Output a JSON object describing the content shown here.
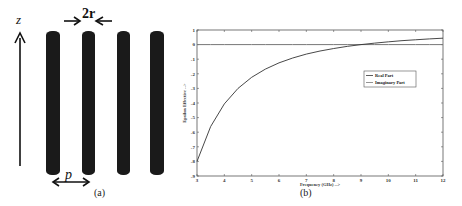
{
  "panel_a": {
    "caption": "(a)",
    "axis_label": "z",
    "radius_label": "2r",
    "period_label": "p",
    "wire_count": 4,
    "wire_color": "#1a1a1a"
  },
  "panel_b": {
    "caption": "(b)"
  },
  "chart_data": {
    "type": "line",
    "title": "",
    "xlabel": "Frequency (GHz) -->",
    "ylabel": "Epsilon Effective -->",
    "xlim": [
      3,
      12
    ],
    "ylim": [
      -9,
      1
    ],
    "xticks": [
      3,
      4,
      5,
      6,
      7,
      8,
      9,
      10,
      11,
      12
    ],
    "yticks": [
      1,
      0,
      -1,
      -2,
      -3,
      -4,
      -5,
      -6,
      -7,
      -8,
      -9
    ],
    "grid": false,
    "legend_position": "center-right",
    "x": [
      3,
      3.5,
      4,
      4.5,
      5,
      5.5,
      6,
      6.5,
      7,
      7.5,
      8,
      8.5,
      9,
      9.5,
      10,
      10.5,
      11,
      11.5,
      12
    ],
    "series": [
      {
        "name": "Real Part",
        "values": [
          -8.0,
          -5.61,
          -4.06,
          -3.0,
          -2.24,
          -1.68,
          -1.25,
          -0.92,
          -0.65,
          -0.44,
          -0.27,
          -0.12,
          0.0,
          0.1,
          0.19,
          0.27,
          0.33,
          0.39,
          0.44
        ]
      },
      {
        "name": "Imaginary Part",
        "values": [
          0,
          0,
          0,
          0,
          0,
          0,
          0,
          0,
          0,
          0,
          0,
          0,
          0,
          0,
          0,
          0,
          0,
          0,
          0
        ]
      }
    ]
  }
}
